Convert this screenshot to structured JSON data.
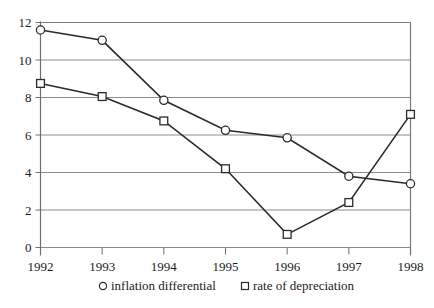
{
  "chart_data": {
    "type": "line",
    "title": "",
    "xlabel": "",
    "ylabel": "",
    "categories": [
      "1992",
      "1993",
      "1994",
      "1995",
      "1996",
      "1997",
      "1998"
    ],
    "x": [
      1992,
      1993,
      1994,
      1995,
      1996,
      1997,
      1998
    ],
    "series": [
      {
        "name": "inflation differential",
        "marker": "circle",
        "values": [
          11.6,
          11.05,
          7.85,
          6.25,
          5.85,
          3.8,
          3.4
        ]
      },
      {
        "name": "rate of depreciation",
        "marker": "square",
        "values": [
          8.75,
          8.05,
          6.75,
          4.2,
          0.7,
          2.4,
          7.1
        ]
      }
    ],
    "ylim": [
      0,
      12
    ],
    "yticks": [
      0,
      2,
      4,
      6,
      8,
      10,
      12
    ],
    "ytick_labels": [
      "0",
      "2",
      "4",
      "6",
      "8",
      "10",
      "12"
    ],
    "xtick_labels": [
      "1992",
      "1993",
      "1994",
      "1995",
      "1996",
      "1997",
      "1998"
    ],
    "grid": true,
    "grid_axis": "y",
    "legend_position": "bottom",
    "line_color": "#2b2b2b",
    "grid_color": "#8c8c8c",
    "marker_fill": "#ffffff",
    "background": "#ffffff"
  },
  "legend": {
    "entries": [
      {
        "marker": "circle",
        "label": "inflation differential"
      },
      {
        "marker": "square",
        "label": "rate of depreciation"
      }
    ]
  }
}
